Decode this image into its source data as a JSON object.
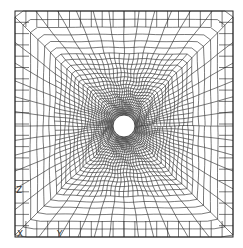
{
  "diagram": {
    "type": "finite-element-mesh",
    "plate": {
      "x": 15,
      "y": 11,
      "width": 218,
      "height": 226
    },
    "hole": {
      "cx": 124,
      "cy": 126,
      "r": 11
    },
    "mesh": {
      "outer_grid_divisions": 20,
      "radial_rings": 26,
      "circumferential_divisions": 96,
      "line_color": "#222222",
      "background": "#ffffff"
    },
    "axes_triad": {
      "labels": {
        "x": "X",
        "y": "Y",
        "z": "Z"
      },
      "positions": {
        "x": {
          "x": 20,
          "y": 234
        },
        "y": {
          "x": 60,
          "y": 234
        },
        "z": {
          "x": 19,
          "y": 190
        }
      }
    }
  }
}
